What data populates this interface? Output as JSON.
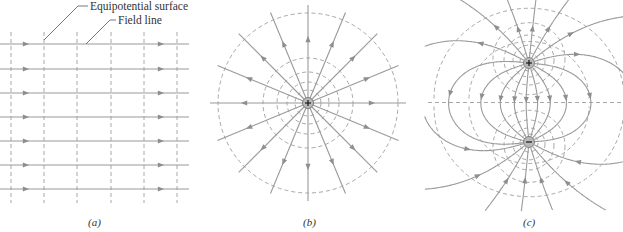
{
  "figure": {
    "panels": [
      {
        "id": "a",
        "label": "(a)",
        "type": "uniform-field"
      },
      {
        "id": "b",
        "label": "(b)",
        "type": "point-charge"
      },
      {
        "id": "c",
        "label": "(c)",
        "type": "electric-dipole"
      }
    ],
    "annotations": {
      "equipotential": "Equipotential surface",
      "field_line": "Field line"
    },
    "charges": {
      "b_center": "+",
      "c_top": "+",
      "c_bottom": "−"
    },
    "colors": {
      "field_line": "#9a9a9a",
      "equipotential": "#a8a8a8",
      "text": "#333333"
    }
  }
}
